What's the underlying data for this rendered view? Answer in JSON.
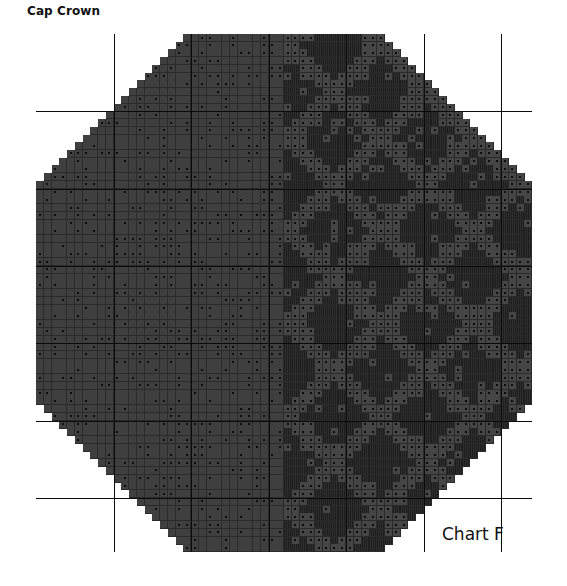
{
  "header": {
    "title": "Cap Crown"
  },
  "footer": {
    "chart_label": "Chart F"
  },
  "chart": {
    "type": "knitting-chart",
    "shape": "octagon",
    "columns": 64,
    "rows": 67,
    "corner_cut_cells": 19,
    "major_grid_every": 10,
    "split_column": 32,
    "cell_types": [
      {
        "name": "purl-dot",
        "color": "#454545",
        "marker": "dot"
      },
      {
        "name": "background-stitch",
        "color": "#2e2e2e",
        "marker": "hatched"
      }
    ],
    "colors": {
      "light_cell": "#454545",
      "dark_cell": "#2e2e2e",
      "left_cell": "#3f3f3f",
      "grid_line": "#0a0a0a"
    }
  }
}
